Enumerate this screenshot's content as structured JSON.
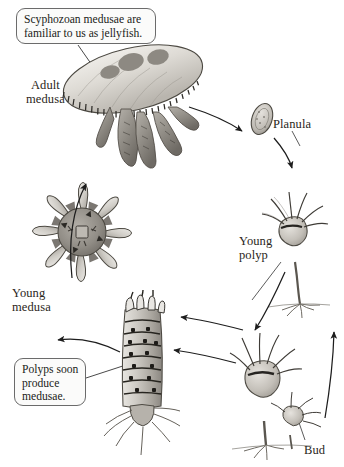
{
  "figure": {
    "background_color": "#ffffff",
    "ink_color": "#2a2520",
    "width": 344,
    "height": 467
  },
  "callouts": [
    {
      "id": "callout-jellyfish",
      "text": "Scyphozoan medusae are\nfamiliar to us as jellyfish.",
      "x": 16,
      "y": 8,
      "w": 140,
      "h": 36
    },
    {
      "id": "callout-polyps",
      "text": "Polyps soon\nproduce\nmedusae.",
      "x": 14,
      "y": 358,
      "w": 72,
      "h": 48
    }
  ],
  "stage_labels": [
    {
      "id": "label-adult-medusa",
      "text": "Adult\nmedusa",
      "x": 26,
      "y": 78,
      "align": "center"
    },
    {
      "id": "label-planula",
      "text": "Planula",
      "x": 273,
      "y": 117,
      "align": "left"
    },
    {
      "id": "label-young-polyp",
      "text": "Young\npolyp",
      "x": 239,
      "y": 234,
      "align": "left"
    },
    {
      "id": "label-young-medusa",
      "text": "Young\nmedusa",
      "x": 12,
      "y": 286,
      "align": "left"
    },
    {
      "id": "label-bud",
      "text": "Bud",
      "x": 304,
      "y": 443,
      "align": "left"
    }
  ],
  "organisms": [
    {
      "id": "adult-medusa",
      "name": "adult-medusa-illustration",
      "caption": "Adult medusa"
    },
    {
      "id": "planula",
      "name": "planula-larva-illustration",
      "caption": "Planula"
    },
    {
      "id": "young-polyp",
      "name": "young-polyp-illustration",
      "caption": "Young polyp"
    },
    {
      "id": "budding-polyp",
      "name": "budding-polyp-illustration",
      "caption": "Bud"
    },
    {
      "id": "strobila",
      "name": "strobila-illustration",
      "caption": "Strobila producing medusae"
    },
    {
      "id": "ephyra",
      "name": "ephyra-illustration",
      "caption": "Young medusa"
    }
  ],
  "cycle_arrows": [
    {
      "id": "arrow-medusa-to-planula",
      "from": "adult-medusa",
      "to": "planula"
    },
    {
      "id": "arrow-planula-to-polyp",
      "from": "planula",
      "to": "young-polyp"
    },
    {
      "id": "arrow-polyp-to-bud",
      "from": "young-polyp",
      "to": "budding-polyp"
    },
    {
      "id": "arrow-bud-to-polyp",
      "from": "budding-polyp",
      "to": "young-polyp"
    },
    {
      "id": "arrow-polyp-to-strobila",
      "from": "young-polyp",
      "to": "strobila"
    },
    {
      "id": "arrow-bud-to-strobila",
      "from": "budding-polyp",
      "to": "strobila"
    },
    {
      "id": "arrow-strobila-to-ephyra",
      "from": "strobila",
      "to": "ephyra"
    },
    {
      "id": "arrow-ephyra-to-medusa",
      "from": "ephyra",
      "to": "adult-medusa"
    }
  ]
}
